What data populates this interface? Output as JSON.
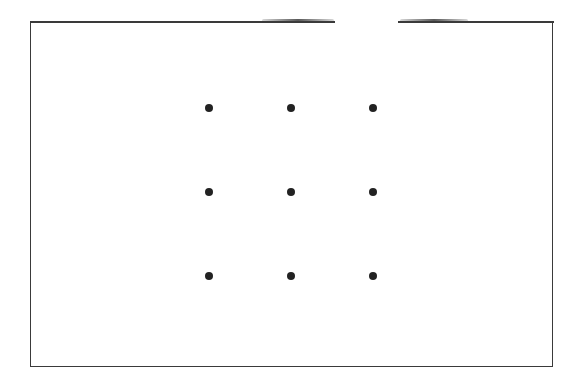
{
  "diagram": {
    "type": "dot-grid-puzzle",
    "frame": {
      "border_color": "#3a3a3a"
    },
    "grid": {
      "rows": 3,
      "cols": 3,
      "dot_color": "#222222"
    },
    "dots": [
      {
        "row": 1,
        "col": 1,
        "x": 209,
        "y": 108
      },
      {
        "row": 1,
        "col": 2,
        "x": 291,
        "y": 108
      },
      {
        "row": 1,
        "col": 3,
        "x": 373,
        "y": 108
      },
      {
        "row": 2,
        "col": 1,
        "x": 209,
        "y": 192
      },
      {
        "row": 2,
        "col": 2,
        "x": 291,
        "y": 192
      },
      {
        "row": 2,
        "col": 3,
        "x": 373,
        "y": 192
      },
      {
        "row": 3,
        "col": 1,
        "x": 209,
        "y": 276
      },
      {
        "row": 3,
        "col": 2,
        "x": 291,
        "y": 276
      },
      {
        "row": 3,
        "col": 3,
        "x": 373,
        "y": 276
      }
    ]
  }
}
